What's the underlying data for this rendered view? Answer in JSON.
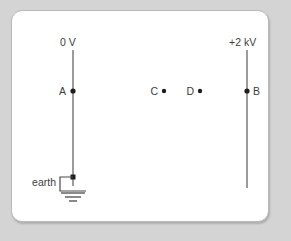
{
  "figure": {
    "type": "physics-circuit-diagram",
    "title": "",
    "background_color": "#d4d4d4",
    "panel_color": "#ffffff",
    "panel_border_color": "#b9b9b9",
    "line_color": "#595959",
    "dot_color": "#1d1d1d",
    "text_color": "#3d3d3d",
    "labels": {
      "left_plate_voltage": "0 V",
      "right_plate_voltage": "+2 kV",
      "earth": "earth",
      "point_a": "A",
      "point_b": "B",
      "point_c": "C",
      "point_d": "D"
    },
    "plates": [
      {
        "name": "left-plate",
        "voltage_label": "0 V",
        "x": 73,
        "y_top": 50,
        "y_bottom": 186
      },
      {
        "name": "right-plate",
        "voltage_label": "+2 kV",
        "x": 247,
        "y_top": 50,
        "y_bottom": 188
      }
    ],
    "points": [
      {
        "label": "A",
        "x": 73,
        "y": 91,
        "label_side": "left",
        "on_plate": "left-plate"
      },
      {
        "label": "C",
        "x": 164,
        "y": 91,
        "label_side": "left",
        "on_plate": null
      },
      {
        "label": "D",
        "x": 200,
        "y": 91,
        "label_side": "left",
        "on_plate": null
      },
      {
        "label": "B",
        "x": 247,
        "y": 91,
        "label_side": "right",
        "on_plate": "right-plate"
      }
    ],
    "earth_symbol": {
      "name": "earth-ground-symbol",
      "junction_x": 73,
      "junction_y": 177,
      "lead_left_x": 60,
      "stem_bottom_y": 191,
      "bars": [
        {
          "half_width": 12,
          "y": 192
        },
        {
          "half_width": 8,
          "y": 196
        },
        {
          "half_width": 4,
          "y": 200
        }
      ]
    }
  }
}
